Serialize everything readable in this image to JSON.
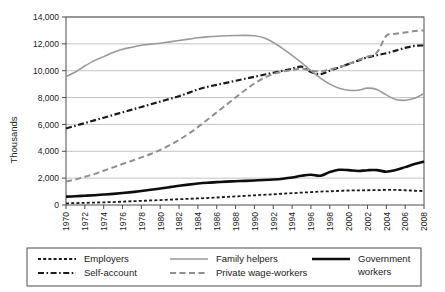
{
  "chart_data": {
    "type": "line",
    "title": "",
    "xlabel": "",
    "ylabel": "Thousands",
    "xlim": [
      1970,
      2008
    ],
    "ylim": [
      0,
      14000
    ],
    "grid": true,
    "legend_position": "bottom",
    "y_ticks": [
      0,
      2000,
      4000,
      6000,
      8000,
      10000,
      12000,
      14000
    ],
    "y_tick_labels": [
      "0",
      "2,000",
      "4,000",
      "6,000",
      "8,000",
      "10,000",
      "12,000",
      "14,000"
    ],
    "x_ticks": [
      1970,
      1972,
      1974,
      1976,
      1978,
      1980,
      1982,
      1984,
      1986,
      1988,
      1990,
      1992,
      1994,
      1996,
      1998,
      2000,
      2002,
      2004,
      2006,
      2008
    ],
    "x_tick_labels": [
      "1970",
      "1972",
      "1974",
      "1976",
      "1978",
      "1980",
      "1982",
      "1984",
      "1986",
      "1988",
      "1990",
      "1992",
      "1994",
      "1996",
      "1998",
      "2000",
      "2002",
      "2004",
      "2006",
      "2008"
    ],
    "x": [
      1970,
      1971,
      1972,
      1973,
      1974,
      1975,
      1976,
      1977,
      1978,
      1979,
      1980,
      1981,
      1982,
      1983,
      1984,
      1985,
      1986,
      1987,
      1988,
      1989,
      1990,
      1991,
      1992,
      1993,
      1994,
      1995,
      1996,
      1997,
      1998,
      1999,
      2000,
      2001,
      2002,
      2003,
      2004,
      2005,
      2006,
      2007,
      2008
    ],
    "series": [
      {
        "name": "Employers",
        "color": "#1a1a1a",
        "style": "short-dash",
        "width": 1.8,
        "values": [
          120,
          140,
          160,
          180,
          200,
          220,
          250,
          280,
          310,
          340,
          370,
          400,
          430,
          460,
          490,
          520,
          560,
          600,
          640,
          680,
          720,
          760,
          800,
          840,
          880,
          920,
          960,
          1000,
          1020,
          1050,
          1080,
          1090,
          1100,
          1110,
          1120,
          1120,
          1100,
          1060,
          1040
        ]
      },
      {
        "name": "Self-account",
        "color": "#1a1a1a",
        "style": "dash-dot",
        "width": 2.2,
        "values": [
          5700,
          5900,
          6100,
          6300,
          6500,
          6700,
          6900,
          7100,
          7300,
          7500,
          7700,
          7900,
          8100,
          8350,
          8600,
          8800,
          8950,
          9100,
          9250,
          9400,
          9550,
          9700,
          9850,
          10000,
          10150,
          10300,
          9900,
          9750,
          10000,
          10250,
          10500,
          10750,
          11000,
          11150,
          11300,
          11500,
          11700,
          11850,
          11880
        ]
      },
      {
        "name": "Family helpers",
        "color": "#9a9a9a",
        "style": "solid",
        "width": 1.6,
        "values": [
          9550,
          9900,
          10350,
          10750,
          11050,
          11350,
          11600,
          11750,
          11900,
          11980,
          12050,
          12150,
          12250,
          12350,
          12450,
          12520,
          12570,
          12600,
          12620,
          12630,
          12600,
          12450,
          12100,
          11650,
          11150,
          10600,
          10000,
          9450,
          9000,
          8700,
          8550,
          8550,
          8700,
          8600,
          8200,
          7850,
          7800,
          7950,
          8300
        ]
      },
      {
        "name": "Private wage-workers",
        "color": "#8f8f8f",
        "style": "long-dash",
        "width": 2.0,
        "values": [
          1750,
          1900,
          2100,
          2300,
          2550,
          2800,
          3050,
          3300,
          3550,
          3800,
          4100,
          4450,
          4850,
          5300,
          5800,
          6350,
          6900,
          7450,
          8000,
          8550,
          9050,
          9450,
          9750,
          9950,
          10050,
          10150,
          10000,
          9950,
          10100,
          10250,
          10500,
          10800,
          11050,
          11350,
          12600,
          12750,
          12850,
          12950,
          13000
        ]
      },
      {
        "name": "Government workers",
        "color": "#0d0d0d",
        "style": "solid",
        "width": 2.6,
        "values": [
          620,
          650,
          690,
          730,
          780,
          830,
          890,
          960,
          1040,
          1130,
          1230,
          1330,
          1430,
          1520,
          1600,
          1660,
          1700,
          1740,
          1770,
          1800,
          1830,
          1860,
          1900,
          1960,
          2050,
          2180,
          2250,
          2180,
          2450,
          2620,
          2600,
          2530,
          2590,
          2600,
          2480,
          2600,
          2820,
          3050,
          3230
        ]
      }
    ]
  },
  "legend": {
    "items": [
      {
        "label": "Employers",
        "series": "Employers"
      },
      {
        "label": "Self-account",
        "series": "Self-account"
      },
      {
        "label": "Family helpers",
        "series": "Family helpers"
      },
      {
        "label": "Private wage-workers",
        "series": "Private wage-workers"
      },
      {
        "label": "Government workers",
        "series": "Government workers"
      }
    ]
  }
}
